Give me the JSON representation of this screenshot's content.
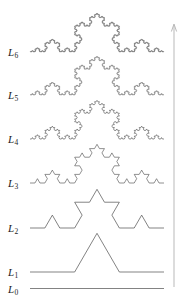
{
  "figure": {
    "type": "koch-curve-iteration-diagram",
    "background_color": "#ffffff",
    "curve_color": "#4d4d4d",
    "label_color": "#1c1c1c",
    "arrow_color": "#b9b9b9",
    "width": 190,
    "height": 302
  },
  "axis": {
    "arrow_name": "iteration-direction-arrow",
    "direction": "up",
    "x": 174,
    "y_top": 24,
    "y_bottom": 287
  },
  "geometry": {
    "x_start": 30,
    "x_end": 164,
    "baselines": [
      288.5,
      272.0,
      228.0,
      183.0,
      139.0,
      95.0,
      52.0
    ]
  },
  "levels": [
    {
      "label_letter": "L",
      "label_subscript": "0",
      "iteration": 0,
      "segments": 1,
      "baseline_y": 288.5,
      "label_x": 8,
      "label_y": 283.5
    },
    {
      "label_letter": "L",
      "label_subscript": "1",
      "iteration": 1,
      "segments": 4,
      "baseline_y": 272.0,
      "label_x": 8,
      "label_y": 267.0
    },
    {
      "label_letter": "L",
      "label_subscript": "2",
      "iteration": 2,
      "segments": 16,
      "baseline_y": 228.0,
      "label_x": 8,
      "label_y": 223.0
    },
    {
      "label_letter": "L",
      "label_subscript": "3",
      "iteration": 3,
      "segments": 64,
      "baseline_y": 183.0,
      "label_x": 8,
      "label_y": 178.0
    },
    {
      "label_letter": "L",
      "label_subscript": "4",
      "iteration": 4,
      "segments": 256,
      "baseline_y": 139.0,
      "label_x": 8,
      "label_y": 134.0
    },
    {
      "label_letter": "L",
      "label_subscript": "5",
      "iteration": 5,
      "segments": 1024,
      "baseline_y": 95.0,
      "label_x": 8,
      "label_y": 90.0
    },
    {
      "label_letter": "L",
      "label_subscript": "6",
      "iteration": 6,
      "segments": 4096,
      "baseline_y": 52.0,
      "label_x": 8,
      "label_y": 47.0
    }
  ]
}
